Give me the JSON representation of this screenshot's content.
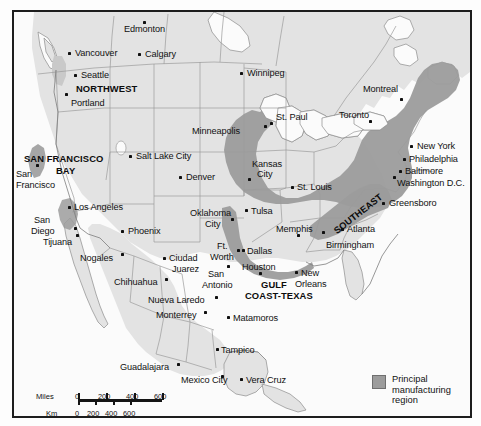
{
  "figure": {
    "kind": "thematic-map"
  },
  "legend": {
    "swatch_color": "#9c9c9c",
    "label": "Principal manufacturing region"
  },
  "scale": {
    "miles_label": "Miles",
    "km_label": "Km",
    "miles_ticks": [
      "0",
      "200",
      "400",
      "600"
    ],
    "km_ticks": [
      "0",
      "200",
      "400",
      "600"
    ]
  },
  "colors": {
    "land": "#e3e3e3",
    "water": "#fbfbfb",
    "manufacturing": "#9c9c9c",
    "border": "#1d1d1d",
    "state_line": "#9b9b9b",
    "dot": "#101010"
  },
  "regions": [
    {
      "name": "NORTHWEST",
      "x": 62,
      "y": 72,
      "rotate": 0
    },
    {
      "name": "SAN FRANCISCO",
      "x": 10,
      "y": 142,
      "rotate": 0
    },
    {
      "name": "BAY",
      "x": 42,
      "y": 154,
      "rotate": 0
    },
    {
      "name": "SOUTHEAST",
      "x": 318,
      "y": 216,
      "rotate": -38
    },
    {
      "name": "GULF",
      "x": 247,
      "y": 268,
      "rotate": 0
    },
    {
      "name": "COAST-TEXAS",
      "x": 231,
      "y": 279,
      "rotate": 0
    }
  ],
  "cities": [
    {
      "name": "Edmonton",
      "lx": 110,
      "ly": 12,
      "dx": 129,
      "dy": 9,
      "align": "left"
    },
    {
      "name": "Vancouver",
      "lx": 61,
      "ly": 36,
      "dx": 54,
      "dy": 40,
      "align": "left"
    },
    {
      "name": "Calgary",
      "lx": 131,
      "ly": 37,
      "dx": 124,
      "dy": 41,
      "align": "left"
    },
    {
      "name": "Seattle",
      "lx": 67,
      "ly": 58,
      "dx": 60,
      "dy": 62,
      "align": "left"
    },
    {
      "name": "Portland",
      "lx": 57,
      "ly": 86,
      "dx": 51,
      "dy": 81,
      "align": "left"
    },
    {
      "name": "Winnipeg",
      "lx": 233,
      "ly": 56,
      "dx": 226,
      "dy": 60,
      "align": "left"
    },
    {
      "name": "Montreal",
      "lx": 349,
      "ly": 72,
      "dx": 386,
      "dy": 86,
      "align": "left"
    },
    {
      "name": "St. Paul",
      "lx": 262,
      "ly": 100,
      "dx": 256,
      "dy": 110,
      "align": "left"
    },
    {
      "name": "Toronto",
      "lx": 325,
      "ly": 98,
      "dx": 355,
      "dy": 108,
      "align": "left"
    },
    {
      "name": "Minneapolis",
      "lx": 178,
      "ly": 114,
      "dx": 250,
      "dy": 113,
      "align": "left"
    },
    {
      "name": "Salt Lake City",
      "lx": 122,
      "ly": 139,
      "dx": 115,
      "dy": 143,
      "align": "left"
    },
    {
      "name": "Denver",
      "lx": 172,
      "ly": 160,
      "dx": 165,
      "dy": 164,
      "align": "left"
    },
    {
      "name": "Kansas",
      "lx": 238,
      "ly": 147,
      "dx": 234,
      "dy": 166,
      "align": "left"
    },
    {
      "name": "City",
      "lx": 243,
      "ly": 157,
      "dx": -99,
      "dy": -99,
      "align": "left"
    },
    {
      "name": "St. Louis",
      "lx": 283,
      "ly": 170,
      "dx": 277,
      "dy": 174,
      "align": "left"
    },
    {
      "name": "New York",
      "lx": 403,
      "ly": 129,
      "dx": 396,
      "dy": 133,
      "align": "left"
    },
    {
      "name": "Philadelphia",
      "lx": 395,
      "ly": 142,
      "dx": 389,
      "dy": 146,
      "align": "left"
    },
    {
      "name": "Baltimore",
      "lx": 391,
      "ly": 154,
      "dx": 385,
      "dy": 158,
      "align": "left"
    },
    {
      "name": "Washington D.C.",
      "lx": 383,
      "ly": 166,
      "dx": 379,
      "dy": 164,
      "align": "left"
    },
    {
      "name": "Greensboro",
      "lx": 375,
      "ly": 186,
      "dx": 368,
      "dy": 190,
      "align": "left"
    },
    {
      "name": "San",
      "lx": 2,
      "ly": 157,
      "dx": 22,
      "dy": 152,
      "align": "left"
    },
    {
      "name": "Francisco",
      "lx": 2,
      "ly": 168,
      "dx": -99,
      "dy": -99,
      "align": "left"
    },
    {
      "name": "Los Angeles",
      "lx": 60,
      "ly": 190,
      "dx": 54,
      "dy": 194,
      "align": "left"
    },
    {
      "name": "San",
      "lx": 20,
      "ly": 203,
      "dx": 60,
      "dy": 215,
      "align": "left"
    },
    {
      "name": "Diego",
      "lx": 17,
      "ly": 214,
      "dx": -99,
      "dy": -99,
      "align": "left"
    },
    {
      "name": "Tijuana",
      "lx": 29,
      "ly": 225,
      "dx": 62,
      "dy": 222,
      "align": "left"
    },
    {
      "name": "Nogales",
      "lx": 66,
      "ly": 241,
      "dx": 107,
      "dy": 241,
      "align": "left"
    },
    {
      "name": "Phoenix",
      "lx": 114,
      "ly": 214,
      "dx": 107,
      "dy": 218,
      "align": "left"
    },
    {
      "name": "Oklahoma",
      "lx": 176,
      "ly": 196,
      "dx": 217,
      "dy": 206,
      "align": "left"
    },
    {
      "name": "City",
      "lx": 191,
      "ly": 207,
      "dx": -99,
      "dy": -99,
      "align": "left"
    },
    {
      "name": "Tulsa",
      "lx": 237,
      "ly": 194,
      "dx": 231,
      "dy": 197,
      "align": "left"
    },
    {
      "name": "Memphis",
      "lx": 262,
      "ly": 212,
      "dx": 283,
      "dy": 222,
      "align": "left"
    },
    {
      "name": "Ft.",
      "lx": 203,
      "ly": 229,
      "dx": 223,
      "dy": 237,
      "align": "left"
    },
    {
      "name": "Worth",
      "lx": 196,
      "ly": 240,
      "dx": -99,
      "dy": -99,
      "align": "left"
    },
    {
      "name": "Dallas",
      "lx": 233,
      "ly": 234,
      "dx": 228,
      "dy": 237,
      "align": "left"
    },
    {
      "name": "Houston",
      "lx": 228,
      "ly": 250,
      "dx": 245,
      "dy": 260,
      "align": "left"
    },
    {
      "name": "Ciudad",
      "lx": 155,
      "ly": 241,
      "dx": 149,
      "dy": 245,
      "align": "left"
    },
    {
      "name": "Juarez",
      "lx": 158,
      "ly": 252,
      "dx": -99,
      "dy": -99,
      "align": "left"
    },
    {
      "name": "San",
      "lx": 194,
      "ly": 257,
      "dx": 213,
      "dy": 253,
      "align": "left"
    },
    {
      "name": "Antonio",
      "lx": 188,
      "ly": 268,
      "dx": -99,
      "dy": -99,
      "align": "left"
    },
    {
      "name": "Chihuahua",
      "lx": 100,
      "ly": 265,
      "dx": 151,
      "dy": 266,
      "align": "left"
    },
    {
      "name": "New",
      "lx": 287,
      "ly": 256,
      "dx": 281,
      "dy": 259,
      "align": "left"
    },
    {
      "name": "Orleans",
      "lx": 281,
      "ly": 267,
      "dx": -99,
      "dy": -99,
      "align": "left"
    },
    {
      "name": "Atlanta",
      "lx": 333,
      "ly": 212,
      "dx": 327,
      "dy": 216,
      "align": "left"
    },
    {
      "name": "Birmingham",
      "lx": 312,
      "ly": 228,
      "dx": 308,
      "dy": 219,
      "align": "left"
    },
    {
      "name": "Nueva Laredo",
      "lx": 134,
      "ly": 283,
      "dx": 201,
      "dy": 284,
      "align": "left"
    },
    {
      "name": "Monterrey",
      "lx": 142,
      "ly": 298,
      "dx": 190,
      "dy": 299,
      "align": "left"
    },
    {
      "name": "Matamoros",
      "lx": 219,
      "ly": 301,
      "dx": 213,
      "dy": 304,
      "align": "left"
    },
    {
      "name": "Tampico",
      "lx": 207,
      "ly": 333,
      "dx": 202,
      "dy": 336,
      "align": "left"
    },
    {
      "name": "Guadalajara",
      "lx": 106,
      "ly": 350,
      "dx": 163,
      "dy": 351,
      "align": "left"
    },
    {
      "name": "Mexico City",
      "lx": 167,
      "ly": 363,
      "dx": 207,
      "dy": 363,
      "align": "left"
    },
    {
      "name": "Vera Cruz",
      "lx": 232,
      "ly": 363,
      "dx": 226,
      "dy": 366,
      "align": "left"
    }
  ]
}
